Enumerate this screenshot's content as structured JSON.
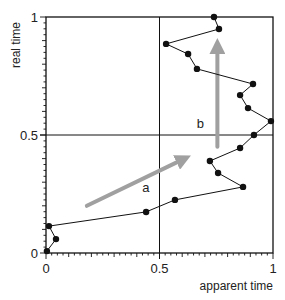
{
  "chart_data": {
    "type": "line",
    "title": "",
    "xlabel": "apparent time",
    "ylabel": "real time",
    "xlim": [
      0,
      1
    ],
    "ylim": [
      0,
      1
    ],
    "grid": false,
    "reference_lines": {
      "x": 0.5,
      "y": 0.5
    },
    "x_ticks": [
      0,
      0.5,
      1
    ],
    "y_ticks": [
      0,
      0.5,
      1
    ],
    "x_tick_labels": [
      "0",
      "0.5",
      "1"
    ],
    "y_tick_labels": [
      "0",
      "0.5",
      "1"
    ],
    "minor_tick_step": 0.025,
    "series": [
      {
        "name": "trajectory",
        "marker": "filled-circle",
        "color": "#111111",
        "points": [
          [
            0.004,
            0.008
          ],
          [
            0.044,
            0.059
          ],
          [
            0.013,
            0.114
          ],
          [
            0.441,
            0.174
          ],
          [
            0.568,
            0.225
          ],
          [
            0.868,
            0.28
          ],
          [
            0.758,
            0.339
          ],
          [
            0.722,
            0.39
          ],
          [
            0.855,
            0.445
          ],
          [
            0.916,
            0.5
          ],
          [
            0.991,
            0.559
          ],
          [
            0.89,
            0.614
          ],
          [
            0.855,
            0.669
          ],
          [
            0.912,
            0.716
          ],
          [
            0.665,
            0.78
          ],
          [
            0.626,
            0.843
          ],
          [
            0.529,
            0.886
          ],
          [
            0.762,
            0.949
          ],
          [
            0.74,
            1.0
          ]
        ]
      }
    ],
    "annotations": [
      {
        "label": "a",
        "x": 0.44,
        "y": 0.26,
        "arrow": {
          "from": [
            0.18,
            0.2
          ],
          "to": [
            0.61,
            0.4
          ],
          "color": "#a0a0a0"
        }
      },
      {
        "label": "b",
        "x": 0.68,
        "y": 0.53,
        "arrow": {
          "from": [
            0.755,
            0.45
          ],
          "to": [
            0.755,
            0.88
          ],
          "color": "#a0a0a0"
        }
      }
    ]
  }
}
